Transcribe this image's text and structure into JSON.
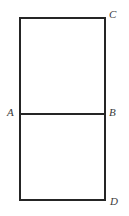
{
  "figure": {
    "type": "geometry-diagram",
    "background_color": "#ffffff",
    "stroke_color": "#252525",
    "stroke_width": 2,
    "label_color": "#3a3a3a",
    "rectangle": {
      "left": 20,
      "top": 18,
      "right": 105,
      "bottom": 200,
      "width": 85,
      "height": 182
    },
    "divider": {
      "name": "segment-AB",
      "y": 114,
      "x_start": 20,
      "x_end": 105
    },
    "labels": [
      {
        "id": "C",
        "text": "C",
        "position": "top-right",
        "x": 109,
        "y": 9
      },
      {
        "id": "A",
        "text": "A",
        "position": "middle-left",
        "x": 7,
        "y": 107
      },
      {
        "id": "B",
        "text": "B",
        "position": "middle-right",
        "x": 109,
        "y": 107
      },
      {
        "id": "D",
        "text": "D",
        "position": "bottom-right",
        "x": 110,
        "y": 196
      }
    ]
  }
}
